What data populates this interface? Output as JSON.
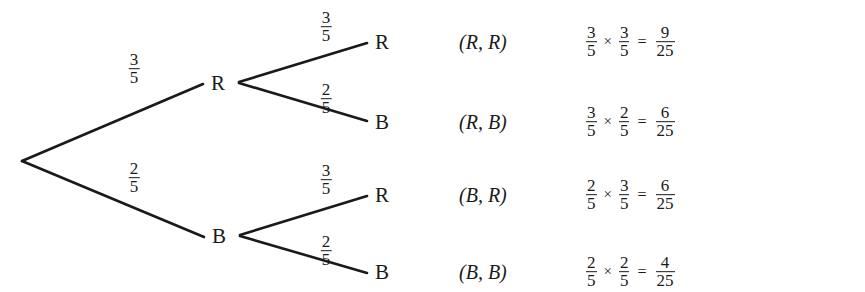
{
  "diagram": {
    "line_color": "#1a1a1a",
    "text_color": "#1a1a1a",
    "background": "#ffffff",
    "root": {
      "label": ""
    },
    "level1": [
      {
        "id": "r",
        "label": "R",
        "branch_prob": {
          "num": "3",
          "den": "5"
        }
      },
      {
        "id": "b",
        "label": "B",
        "branch_prob": {
          "num": "2",
          "den": "5"
        }
      }
    ],
    "level2": [
      {
        "id": "rr",
        "label": "R",
        "branch_prob": {
          "num": "3",
          "den": "5"
        }
      },
      {
        "id": "rb",
        "label": "B",
        "branch_prob": {
          "num": "2",
          "den": "5"
        }
      },
      {
        "id": "br",
        "label": "R",
        "branch_prob": {
          "num": "3",
          "den": "5"
        }
      },
      {
        "id": "bb",
        "label": "B",
        "branch_prob": {
          "num": "2",
          "den": "5"
        }
      }
    ],
    "outcomes": [
      {
        "pair": "(R, R)",
        "factor1": {
          "num": "3",
          "den": "5"
        },
        "operator": "×",
        "factor2": {
          "num": "3",
          "den": "5"
        },
        "equals": "=",
        "result": {
          "num": "9",
          "den": "25"
        }
      },
      {
        "pair": "(R, B)",
        "factor1": {
          "num": "3",
          "den": "5"
        },
        "operator": "×",
        "factor2": {
          "num": "2",
          "den": "5"
        },
        "equals": "=",
        "result": {
          "num": "6",
          "den": "25"
        }
      },
      {
        "pair": "(B, R)",
        "factor1": {
          "num": "2",
          "den": "5"
        },
        "operator": "×",
        "factor2": {
          "num": "3",
          "den": "5"
        },
        "equals": "=",
        "result": {
          "num": "6",
          "den": "25"
        }
      },
      {
        "pair": "(B, B)",
        "factor1": {
          "num": "2",
          "den": "5"
        },
        "operator": "×",
        "factor2": {
          "num": "2",
          "den": "5"
        },
        "equals": "=",
        "result": {
          "num": "4",
          "den": "25"
        }
      }
    ]
  }
}
